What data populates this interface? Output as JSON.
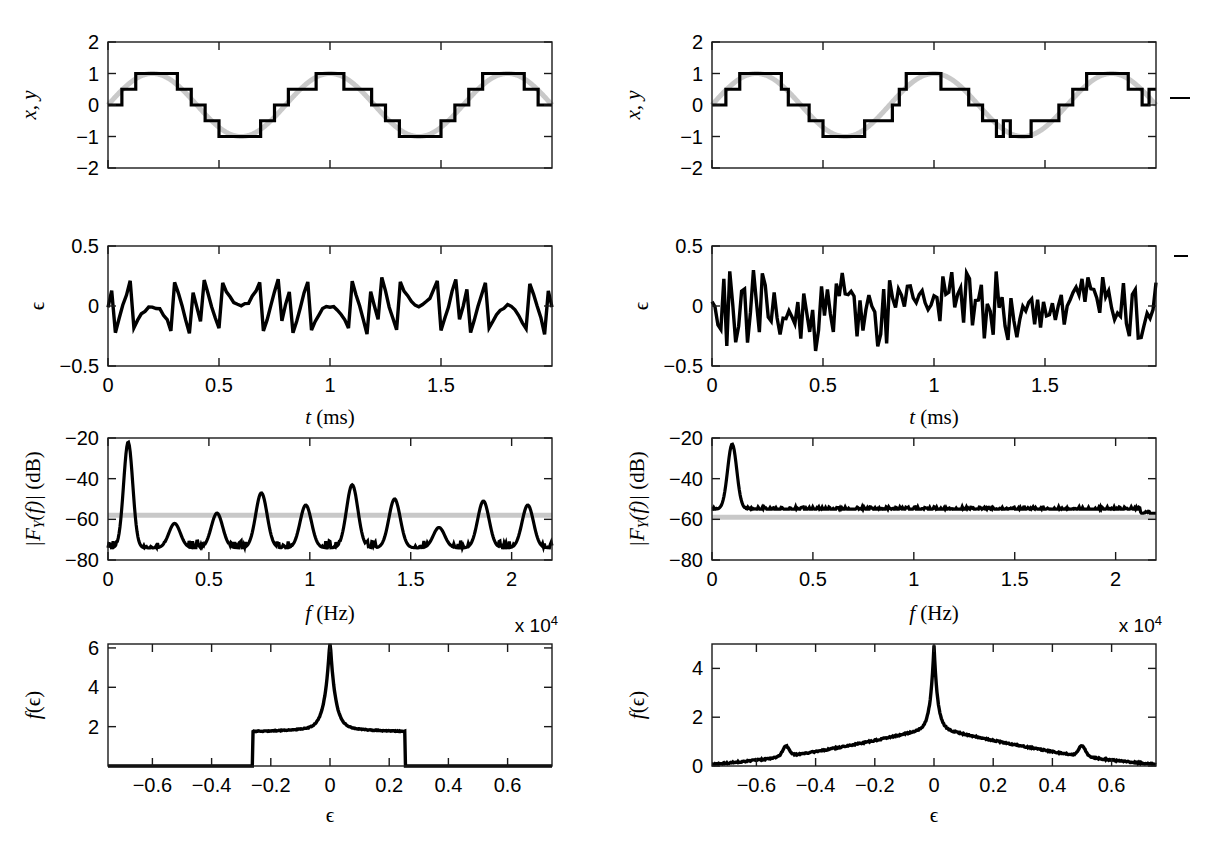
{
  "figure": {
    "title": "",
    "columns": [
      {
        "id": "left",
        "name": "undithered-quantization"
      },
      {
        "id": "right",
        "name": "dithered-quantization"
      }
    ]
  },
  "chart_data": [
    {
      "id": "signal-left",
      "type": "line",
      "title": "",
      "xlabel": "",
      "ylabel": "x, y",
      "xlim": [
        0,
        2
      ],
      "ylim": [
        -2,
        2
      ],
      "yticks": [
        -2,
        -1,
        0,
        1,
        2
      ],
      "yticklabels": [
        "-2",
        "-1",
        "0",
        "1",
        "2"
      ],
      "xticks": [
        0,
        0.5,
        1,
        1.5
      ],
      "xticklabels": [],
      "grid": false,
      "legend": "none",
      "series": [
        {
          "name": "x (input sine, gray)",
          "color": "#c8c8c8",
          "kind": "sine",
          "amplitude": 1.0,
          "cycles": 2.5,
          "phase": 0
        },
        {
          "name": "y (quantized, black)",
          "color": "#000000",
          "kind": "staircase",
          "step": 0.5,
          "amplitude": 1.0,
          "cycles": 2.5,
          "dither": 0
        }
      ]
    },
    {
      "id": "signal-right",
      "type": "line",
      "title": "",
      "xlabel": "",
      "ylabel": "x, y",
      "xlim": [
        0,
        2
      ],
      "ylim": [
        -2,
        2
      ],
      "yticks": [
        -2,
        -1,
        0,
        1,
        2
      ],
      "yticklabels": [
        "-2",
        "-1",
        "0",
        "1",
        "2"
      ],
      "xticks": [
        0,
        0.5,
        1,
        1.5
      ],
      "xticklabels": [],
      "grid": false,
      "legend": "none",
      "series": [
        {
          "name": "x (input sine, gray)",
          "color": "#c8c8c8",
          "kind": "sine",
          "amplitude": 1.0,
          "cycles": 2.5,
          "phase": 0
        },
        {
          "name": "y (dithered quantized, black)",
          "color": "#000000",
          "kind": "staircase",
          "step": 0.5,
          "amplitude": 1.0,
          "cycles": 2.5,
          "dither": 0.5
        }
      ]
    },
    {
      "id": "error-left",
      "type": "line",
      "title": "",
      "xlabel": "t (ms)",
      "ylabel": "ϵ",
      "xlim": [
        0,
        2
      ],
      "ylim": [
        -0.5,
        0.5
      ],
      "yticks": [
        -0.5,
        0,
        0.5
      ],
      "yticklabels": [
        "-0.5",
        "0",
        "0.5"
      ],
      "xticks": [
        0,
        0.5,
        1,
        1.5
      ],
      "xticklabels": [
        "0",
        "0.5",
        "1",
        "1.5"
      ],
      "grid": false,
      "legend": "none",
      "series": [
        {
          "name": "quantization error (correlated sawtooth)",
          "color": "#000000",
          "kind": "error-undithered",
          "bound": 0.25
        }
      ]
    },
    {
      "id": "error-right",
      "type": "line",
      "title": "",
      "xlabel": "t (ms)",
      "ylabel": "ϵ",
      "xlim": [
        0,
        2
      ],
      "ylim": [
        -0.5,
        0.5
      ],
      "yticks": [
        -0.5,
        0,
        0.5
      ],
      "yticklabels": [
        "-0.5",
        "0",
        "0.5"
      ],
      "xticks": [
        0,
        0.5,
        1,
        1.5
      ],
      "xticklabels": [
        "0",
        "0.5",
        "1",
        "1.5"
      ],
      "grid": false,
      "legend": "none",
      "series": [
        {
          "name": "total error with dither (white)",
          "color": "#000000",
          "kind": "error-dithered",
          "bound": 0.5
        }
      ]
    },
    {
      "id": "spectrum-left",
      "type": "line",
      "title": "",
      "xlabel": "f (Hz)",
      "ylabel": "|F_Y(f)| (dB)",
      "xlim": [
        0,
        22000
      ],
      "ylim": [
        -80,
        -20
      ],
      "yticks": [
        -80,
        -60,
        -40,
        -20
      ],
      "yticklabels": [
        "-80",
        "-60",
        "-40",
        "-20"
      ],
      "xticks": [
        0,
        5000,
        10000,
        15000,
        20000
      ],
      "xticklabels": [
        "0",
        "0.5",
        "1",
        "1.5",
        "2"
      ],
      "x_multiplier": "x 10",
      "x_multiplier_exp": "4",
      "grid": false,
      "legend": "none",
      "reference_line": {
        "name": "theoretical noise floor",
        "color": "#c8c8c8",
        "y": -58
      },
      "fundamental_hz": 1000,
      "fundamental_db": -22,
      "noise_floor_db": -74,
      "harmonics": [
        {
          "f_hz": 1000,
          "db": -22
        },
        {
          "f_hz": 3300,
          "db": -62
        },
        {
          "f_hz": 5400,
          "db": -57
        },
        {
          "f_hz": 7600,
          "db": -47
        },
        {
          "f_hz": 9800,
          "db": -53
        },
        {
          "f_hz": 12100,
          "db": -43
        },
        {
          "f_hz": 14200,
          "db": -50
        },
        {
          "f_hz": 16400,
          "db": -64
        },
        {
          "f_hz": 18600,
          "db": -51
        },
        {
          "f_hz": 20800,
          "db": -53
        }
      ],
      "series": [
        {
          "name": "|F_Y(f)| undithered",
          "color": "#000000",
          "kind": "spectrum-harmonic"
        }
      ]
    },
    {
      "id": "spectrum-right",
      "type": "line",
      "title": "",
      "xlabel": "f (Hz)",
      "ylabel": "|F_Y(f)| (dB)",
      "xlim": [
        0,
        22000
      ],
      "ylim": [
        -80,
        -20
      ],
      "yticks": [
        -80,
        -60,
        -40,
        -20
      ],
      "yticklabels": [
        "-80",
        "-60",
        "-40",
        "-20"
      ],
      "xticks": [
        0,
        5000,
        10000,
        15000,
        20000
      ],
      "xticklabels": [
        "0",
        "0.5",
        "1",
        "1.5",
        "2"
      ],
      "x_multiplier": "x 10",
      "x_multiplier_exp": "4",
      "grid": false,
      "legend": "none",
      "reference_line": {
        "name": "theoretical noise floor",
        "color": "#c8c8c8",
        "y": -59
      },
      "fundamental_hz": 1000,
      "fundamental_db": -23,
      "noise_floor_db": -55,
      "harmonics": [
        {
          "f_hz": 1000,
          "db": -23
        }
      ],
      "series": [
        {
          "name": "|F_Y(f)| dithered",
          "color": "#000000",
          "kind": "spectrum-flat"
        }
      ]
    },
    {
      "id": "pdf-left",
      "type": "line",
      "title": "",
      "xlabel": "ϵ",
      "ylabel": "f(ϵ)",
      "xlim": [
        -0.75,
        0.75
      ],
      "ylim": [
        0,
        6.2
      ],
      "yticks": [
        2,
        4,
        6
      ],
      "yticklabels": [
        "2",
        "4",
        "6"
      ],
      "xticks": [
        -0.6,
        -0.4,
        -0.2,
        0,
        0.2,
        0.4,
        0.6
      ],
      "xticklabels": [
        "-0.6",
        "-0.4",
        "-0.2",
        "0",
        "0.2",
        "0.4",
        "0.6"
      ],
      "grid": false,
      "legend": "none",
      "plateau_level": 1.7,
      "plateau_range": [
        -0.255,
        0.25
      ],
      "peak_value": 6.2,
      "peak_at": 0,
      "series": [
        {
          "name": "error pdf (undithered)",
          "color": "#000000",
          "kind": "pdf-plateau"
        }
      ]
    },
    {
      "id": "pdf-right",
      "type": "line",
      "title": "",
      "xlabel": "ϵ",
      "ylabel": "f(ϵ)",
      "xlim": [
        -0.75,
        0.75
      ],
      "ylim": [
        0,
        5.0
      ],
      "yticks": [
        0,
        2,
        4
      ],
      "yticklabels": [
        "0",
        "2",
        "4"
      ],
      "xticks": [
        -0.6,
        -0.4,
        -0.2,
        0,
        0.2,
        0.4,
        0.6
      ],
      "xticklabels": [
        "-0.6",
        "-0.4",
        "-0.2",
        "0",
        "0.2",
        "0.4",
        "0.6"
      ],
      "grid": false,
      "legend": "none",
      "peak_value": 4.95,
      "peak_at": 0,
      "side_bumps": [
        {
          "at": -0.5,
          "value": 0.75
        },
        {
          "at": 0.5,
          "value": 0.8
        }
      ],
      "tail_value": 0.08,
      "series": [
        {
          "name": "error pdf (dithered)",
          "color": "#000000",
          "kind": "pdf-triangular"
        }
      ]
    }
  ],
  "axis_labels": {
    "signal_y": "x, y",
    "error_y": "ϵ",
    "time_x_sym": "t",
    "time_x_unit": "(ms)",
    "spec_y_pre": "|F",
    "spec_y_sub": "Y",
    "spec_y_mid": "(f)| ",
    "spec_y_unit": "(dB)",
    "freq_x_sym": "f",
    "freq_x_unit": "(Hz)",
    "pdf_y_pre": "f",
    "pdf_y_arg": "(ϵ)",
    "pdf_x": "ϵ",
    "multiplier": "x 10",
    "multiplier_exp": "4"
  },
  "colors": {
    "trace": "#000000",
    "reference": "#c8c8c8",
    "axis": "#000000",
    "background": "#ffffff"
  }
}
